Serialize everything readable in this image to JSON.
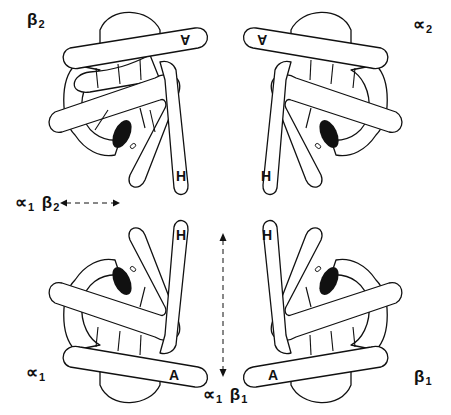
{
  "diagram": {
    "subunits": [
      {
        "id": "beta2",
        "label_symbol": "β",
        "label_sub": "2",
        "position": "top-left",
        "helix_labels": {
          "H": "H",
          "A": "A"
        }
      },
      {
        "id": "alpha2",
        "label_symbol": "∝",
        "label_sub": "2",
        "position": "top-right",
        "helix_labels": {
          "H": "H",
          "A": "A"
        }
      },
      {
        "id": "alpha1",
        "label_symbol": "∝",
        "label_sub": "1",
        "position": "bottom-left",
        "helix_labels": {
          "H": "H",
          "A": "A"
        }
      },
      {
        "id": "beta1",
        "label_symbol": "β",
        "label_sub": "1",
        "position": "bottom-right",
        "helix_labels": {
          "H": "H",
          "A": "A"
        }
      }
    ],
    "interfaces": [
      {
        "id": "alpha1-beta2",
        "sym1": "∝",
        "sub1": "1",
        "sym2": "β",
        "sub2": "2",
        "arrow": "horizontal-dashed-double"
      },
      {
        "id": "alpha1-beta1",
        "sym1": "∝",
        "sub1": "1",
        "sym2": "β",
        "sub2": "1",
        "arrow": "vertical-dashed-double"
      }
    ],
    "colors": {
      "stroke": "#111111",
      "heme": "#111111",
      "background": "#ffffff"
    }
  }
}
